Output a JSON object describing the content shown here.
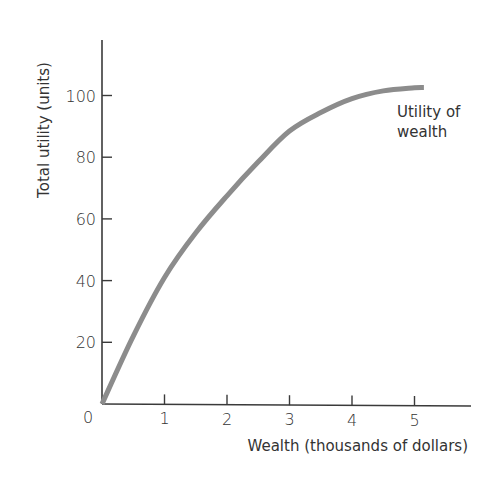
{
  "chart_data": {
    "type": "line",
    "title": "",
    "xlabel": "Wealth (thousands of dollars)",
    "ylabel": "Total utility (units)",
    "xlim": [
      0,
      5.8
    ],
    "ylim": [
      0,
      115
    ],
    "x_ticks": [
      "1",
      "2",
      "3",
      "4",
      "5"
    ],
    "y_ticks": [
      "20",
      "40",
      "60",
      "80",
      "100"
    ],
    "origin_label": "0",
    "grid": false,
    "legend": null,
    "series": [
      {
        "name": "Utility of wealth",
        "color": "#8c8c8c",
        "x": [
          0,
          0.5,
          1,
          1.5,
          2,
          2.5,
          3,
          3.5,
          4,
          4.5,
          5,
          5.15
        ],
        "y": [
          0,
          22,
          41,
          55.5,
          67.5,
          78.5,
          88.5,
          94.5,
          99,
          101.5,
          102.5,
          102.6
        ]
      }
    ],
    "annotations": [
      {
        "text_line1": "Utility of",
        "text_line2": "wealth",
        "x": 4.45,
        "y": 94
      }
    ]
  }
}
